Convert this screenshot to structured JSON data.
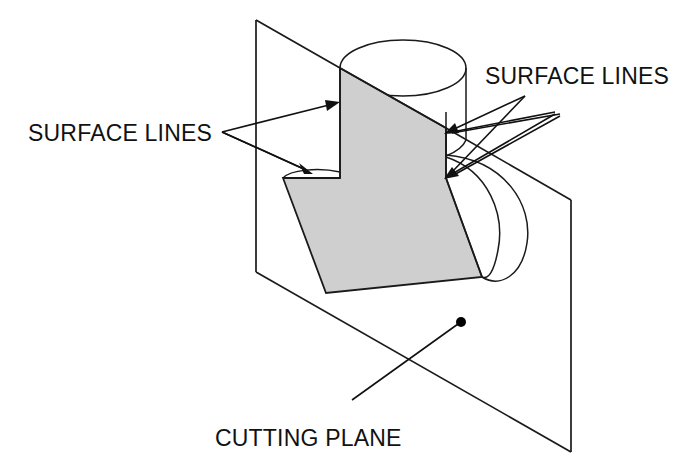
{
  "diagram": {
    "background_color": "#ffffff",
    "line_color": "#1a1a1a",
    "section_fill_color": "#cfcfcf",
    "labels": {
      "surface_lines_left": "SURFACE LINES",
      "surface_lines_right": "SURFACE LINES",
      "cutting_plane": "CUTTING PLANE"
    },
    "annotations": [
      {
        "id": "surface-lines-left",
        "text": "SURFACE LINES",
        "text_anchor_x": 28,
        "text_baseline_y": 141,
        "leader_origin": [
          222,
          132
        ],
        "pointers": 2
      },
      {
        "id": "surface-lines-right",
        "text": "SURFACE LINES",
        "text_anchor_x": 485,
        "text_baseline_y": 84,
        "leader_origin": [
          525,
          96
        ],
        "pointers": 4
      },
      {
        "id": "cutting-plane",
        "text": "CUTTING PLANE",
        "text_anchor_x": 215,
        "text_baseline_y": 446,
        "leader_origin": [
          352,
          400
        ],
        "leader_target": [
          461,
          322
        ],
        "pointers": 0
      }
    ],
    "geometry": {
      "cutting_plane_quad": [
        [
          256,
          20
        ],
        [
          571,
          200
        ],
        [
          571,
          452
        ],
        [
          256,
          272
        ]
      ],
      "section_polygon": [
        [
          340,
          68
        ],
        [
          446,
          155
        ],
        [
          446,
          178
        ],
        [
          482,
          277
        ],
        [
          326,
          293
        ],
        [
          283,
          178
        ],
        [
          340,
          178
        ]
      ],
      "top_cylinder_ellipse": {
        "cx": 403,
        "cy": 68,
        "rx": 63,
        "ry": 28
      },
      "lower_bulge_arc": {
        "from": [
          446,
          155
        ],
        "to": [
          482,
          277
        ],
        "bulge_x": 527
      },
      "dot": {
        "cx": 461,
        "cy": 322,
        "r": 5
      }
    }
  }
}
